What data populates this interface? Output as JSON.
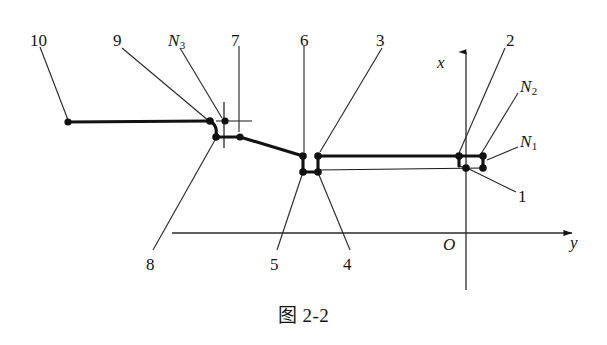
{
  "figure": {
    "caption": "图 2-2",
    "axes": {
      "x_axis_label": "x",
      "y_axis_label": "y",
      "origin_label": "O"
    },
    "callouts": [
      {
        "id": "callout-10",
        "label": "10",
        "x": 30,
        "y": 32
      },
      {
        "id": "callout-9",
        "label": "9",
        "x": 113,
        "y": 32
      },
      {
        "id": "callout-N3",
        "label": "N",
        "sub": "3",
        "x": 168,
        "y": 32
      },
      {
        "id": "callout-7",
        "label": "7",
        "x": 231,
        "y": 32
      },
      {
        "id": "callout-6",
        "label": "6",
        "x": 300,
        "y": 32
      },
      {
        "id": "callout-3",
        "label": "3",
        "x": 376,
        "y": 32
      },
      {
        "id": "callout-2",
        "label": "2",
        "x": 506,
        "y": 32
      },
      {
        "id": "callout-N2",
        "label": "N",
        "sub": "2",
        "x": 520,
        "y": 78
      },
      {
        "id": "callout-N1",
        "label": "N",
        "sub": "1",
        "x": 520,
        "y": 133
      },
      {
        "id": "callout-1",
        "label": "1",
        "x": 518,
        "y": 188
      },
      {
        "id": "callout-8",
        "label": "8",
        "x": 146,
        "y": 256
      },
      {
        "id": "callout-5",
        "label": "5",
        "x": 270,
        "y": 256
      },
      {
        "id": "callout-4",
        "label": "4",
        "x": 343,
        "y": 256
      }
    ],
    "axis_labels": [
      {
        "id": "axis-label-x",
        "label": "x",
        "x": 437,
        "y": 54
      },
      {
        "id": "axis-label-y",
        "label": "y",
        "x": 570,
        "y": 234
      },
      {
        "id": "axis-label-O",
        "label": "O",
        "x": 443,
        "y": 236
      }
    ]
  },
  "geometry": {
    "nodes": [
      {
        "name": "node-10",
        "cx": 68,
        "cy": 122
      },
      {
        "name": "node-9",
        "cx": 212,
        "cy": 122
      },
      {
        "name": "node-N3",
        "cx": 225,
        "cy": 122
      },
      {
        "name": "node-8",
        "cx": 216,
        "cy": 137
      },
      {
        "name": "node-7",
        "cx": 240,
        "cy": 137
      },
      {
        "name": "node-6",
        "cx": 303,
        "cy": 156
      },
      {
        "name": "node-3",
        "cx": 318,
        "cy": 156
      },
      {
        "name": "node-5",
        "cx": 303,
        "cy": 172
      },
      {
        "name": "node-4",
        "cx": 318,
        "cy": 172
      },
      {
        "name": "node-2",
        "cx": 459,
        "cy": 156
      },
      {
        "name": "node-N2",
        "cx": 483,
        "cy": 156
      },
      {
        "name": "node-1",
        "cx": 466,
        "cy": 168
      },
      {
        "name": "node-N1",
        "cx": 483,
        "cy": 168
      }
    ],
    "axes": {
      "x_axis": {
        "x": 466,
        "y_top": 46,
        "y_bottom": 290
      },
      "y_axis": {
        "y": 233,
        "x_left": 172,
        "x_right": 578
      }
    }
  }
}
